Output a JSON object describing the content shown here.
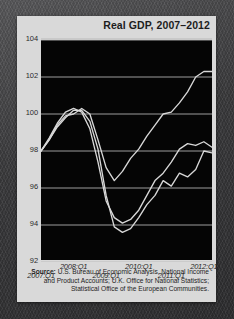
{
  "figure": {
    "title": "Real GDP, 2007–2012",
    "source_label": "Source:",
    "source_text": " U.S. Bureau of Economic Analysis, National Income and Product Accounts; U.K. Office for National Statistics; Statistical Office of the European Communities."
  },
  "chart_data": {
    "type": "line",
    "title": "Real GDP, 2007–2012",
    "xlabel": "",
    "ylabel": "",
    "ylim": [
      92,
      104
    ],
    "xlim": [
      2007.0,
      2012.25
    ],
    "yticks": [
      92,
      94,
      96,
      98,
      100,
      102,
      104
    ],
    "ytick_labels": [
      "92",
      "94",
      "96",
      "98",
      "100",
      "102",
      "104"
    ],
    "xticks": [
      2007.0,
      2008.0,
      2009.0,
      2010.0,
      2011.0,
      2012.0
    ],
    "xtick_labels": [
      "2007:Q1",
      "2008:Q1",
      "2009:Q1",
      "2010:Q1",
      "2011:Q1",
      "2012:Q1"
    ],
    "grid": true,
    "grid_axis": "y",
    "legend": "none",
    "line_color": "#d8d8d8",
    "background_color": "#050505",
    "panel_color": "#d9d9d9",
    "x": [
      2007.0,
      2007.25,
      2007.5,
      2007.75,
      2008.0,
      2008.25,
      2008.5,
      2008.75,
      2009.0,
      2009.25,
      2009.5,
      2009.75,
      2010.0,
      2010.25,
      2010.5,
      2010.75,
      2011.0,
      2011.25,
      2011.5,
      2011.75,
      2012.0,
      2012.25
    ],
    "series": [
      {
        "name": "United States",
        "values": [
          98.0,
          98.6,
          99.4,
          99.9,
          100.0,
          100.3,
          100.0,
          98.6,
          97.1,
          96.4,
          96.9,
          97.6,
          98.1,
          98.8,
          99.4,
          100.0,
          100.1,
          100.6,
          101.2,
          102.0,
          102.3,
          102.3
        ]
      },
      {
        "name": "United Kingdom",
        "values": [
          98.0,
          98.7,
          99.5,
          100.1,
          100.3,
          100.1,
          99.2,
          97.4,
          95.3,
          94.4,
          94.1,
          94.3,
          94.8,
          95.6,
          96.4,
          96.8,
          97.4,
          98.1,
          98.4,
          98.3,
          98.5,
          98.2
        ]
      },
      {
        "name": "Euro Area",
        "values": [
          98.0,
          98.6,
          99.3,
          99.8,
          100.2,
          100.2,
          99.6,
          98.1,
          95.6,
          93.9,
          93.6,
          93.8,
          94.4,
          95.1,
          95.6,
          96.4,
          96.1,
          96.8,
          96.6,
          97.0,
          98.0,
          97.9
        ]
      }
    ]
  }
}
